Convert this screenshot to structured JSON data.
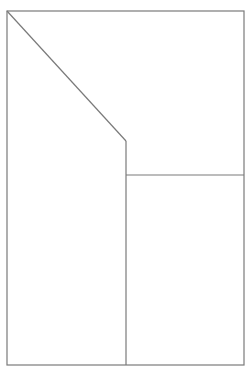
{
  "diagram": {
    "width": 248,
    "height": 370,
    "background": "#ffffff",
    "stroke_color": "#7a7a7a",
    "stroke_width": 1.2,
    "outer_frame": {
      "x1": 7,
      "y1": 11,
      "x2": 244,
      "y2": 365
    },
    "lines": [
      {
        "id": "diagonal",
        "x1": 7,
        "y1": 11,
        "x2": 126,
        "y2": 141
      },
      {
        "id": "middle-vertical",
        "x1": 126,
        "y1": 141,
        "x2": 126,
        "y2": 365
      },
      {
        "id": "right-horizontal",
        "x1": 126,
        "y1": 175,
        "x2": 244,
        "y2": 175
      }
    ]
  }
}
